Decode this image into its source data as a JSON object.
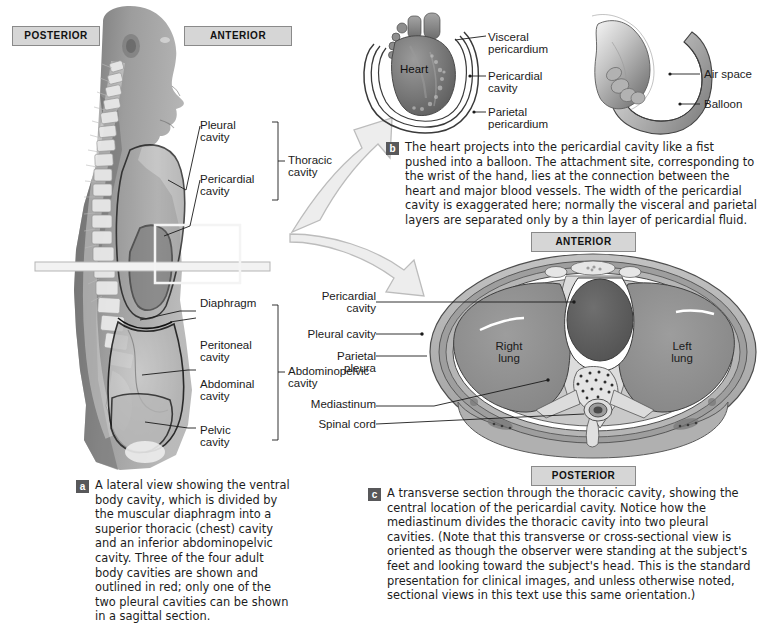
{
  "figure": {
    "panels": [
      "a",
      "b",
      "c"
    ]
  },
  "colors": {
    "orientation_box_fill": "#d6d6d6",
    "orientation_box_border": "#8a8a8a",
    "badge_fill": "#58585a",
    "arrow_fill": "#ececec",
    "arrow_stroke": "#b9b9b9",
    "lung_fill": "#8e8e8e",
    "heart_fill": "#5e5e5e",
    "mediastinum_fill": "#d8d8d8",
    "body_wall_fill": "#a9a9a9",
    "skin_fill": "#bdbdbd",
    "cavity_outline": "#111111",
    "text": "#1b1b1b"
  },
  "panel_a": {
    "orientation": {
      "posterior": "POSTERIOR",
      "anterior": "ANTERIOR"
    },
    "labels": [
      {
        "id": "pleural-cavity",
        "text_lines": [
          "Pleural",
          "cavity"
        ]
      },
      {
        "id": "pericardial-cavity",
        "text_lines": [
          "Pericardial",
          "cavity"
        ]
      },
      {
        "id": "thoracic-cavity",
        "text_lines": [
          "Thoracic",
          "cavity"
        ]
      },
      {
        "id": "diaphragm",
        "text_lines": [
          "Diaphragm"
        ]
      },
      {
        "id": "peritoneal-cavity",
        "text_lines": [
          "Peritoneal",
          "cavity"
        ]
      },
      {
        "id": "abdominal-cavity",
        "text_lines": [
          "Abdominal",
          "cavity"
        ]
      },
      {
        "id": "pelvic-cavity",
        "text_lines": [
          "Pelvic",
          "cavity"
        ]
      },
      {
        "id": "abdominopelvic-cavity",
        "text_lines": [
          "Abdominopelvic",
          "cavity"
        ]
      }
    ],
    "label_text": {
      "pleural_1": "Pleural",
      "pleural_2": "cavity",
      "pericardial_1": "Pericardial",
      "pericardial_2": "cavity",
      "thoracic_1": "Thoracic",
      "thoracic_2": "cavity",
      "diaphragm": "Diaphragm",
      "peritoneal_1": "Peritoneal",
      "peritoneal_2": "cavity",
      "abdominal_1": "Abdominal",
      "abdominal_2": "cavity",
      "pelvic_1": "Pelvic",
      "pelvic_2": "cavity",
      "abdominopelvic_1": "Abdominopelvic",
      "abdominopelvic_2": "cavity"
    },
    "caption_badge": "a",
    "caption": "A lateral view showing the ventral body cavity, which is divided by the muscular diaphragm into a superior thoracic (chest) cavity and an inferior abdominopelvic cavity. Three of the four adult body cavities are shown and outlined in red; only one of the two pleural cavities can be shown in a sagittal section."
  },
  "panel_b": {
    "heart_diagram": {
      "inner_label": "Heart",
      "labels": {
        "visceral_1": "Visceral",
        "visceral_2": "pericardium",
        "pericardial_1": "Pericardial",
        "pericardial_2": "cavity",
        "parietal_1": "Parietal",
        "parietal_2": "pericardium"
      }
    },
    "balloon_diagram": {
      "labels": {
        "air_space": "Air space",
        "balloon": "Balloon"
      }
    },
    "caption_badge": "b",
    "caption": "The heart projects into the pericardial cavity like a fist pushed into a balloon. The attachment site, corresponding to the wrist of the hand, lies at the connection between the heart and major blood vessels. The width of the pericardial cavity is exaggerated here; normally the visceral and parietal layers are separated only by a thin layer of pericardial fluid."
  },
  "panel_c": {
    "orientation": {
      "anterior": "ANTERIOR",
      "posterior": "POSTERIOR"
    },
    "labels": {
      "pericardial_1": "Pericardial",
      "pericardial_2": "cavity",
      "pleural_cavity": "Pleural cavity",
      "parietal_1": "Parietal",
      "parietal_2": "pleura",
      "mediastinum": "Mediastinum",
      "spinal_cord": "Spinal cord",
      "right_lung_1": "Right",
      "right_lung_2": "lung",
      "left_lung_1": "Left",
      "left_lung_2": "lung"
    },
    "caption_badge": "c",
    "caption": "A transverse section through the thoracic cavity, showing the central location of the pericardial cavity. Notice how the mediastinum divides the thoracic cavity into two pleural cavities. (Note that this transverse or cross-sectional view is oriented as though the observer were standing at the subject's feet and looking toward the subject's head. This is the standard presentation for clinical images, and unless otherwise noted, sectional views in this text use this same orientation.)"
  }
}
